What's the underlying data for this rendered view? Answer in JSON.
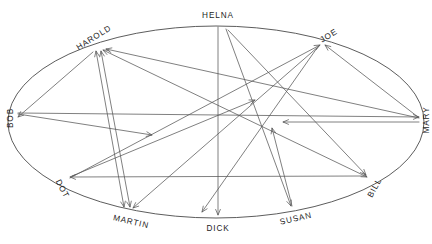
{
  "diagram": {
    "type": "directed-graph-on-ellipse",
    "colors": {
      "background": "#ffffff",
      "ellipse_stroke": "#4a4a4a",
      "edge_stroke": "#555555",
      "label_text": "#1d1d1d"
    },
    "ellipse": {
      "cx": 216,
      "cy": 122,
      "rx": 208,
      "ry": 96
    },
    "nodes": [
      {
        "id": "helna",
        "label": "HELNA",
        "x": 218,
        "y": 26,
        "label_x": 218,
        "label_y": 16,
        "rotate": 0,
        "anchor": "middle"
      },
      {
        "id": "joe",
        "label": "JOE",
        "x": 322,
        "y": 43,
        "label_x": 329,
        "label_y": 36,
        "rotate": -32,
        "anchor": "middle"
      },
      {
        "id": "mary",
        "label": "MARY",
        "x": 422,
        "y": 118,
        "label_x": 427,
        "label_y": 120,
        "rotate": -90,
        "anchor": "middle"
      },
      {
        "id": "bill",
        "label": "BILL",
        "x": 369,
        "y": 179,
        "label_x": 375,
        "label_y": 188,
        "rotate": -62,
        "anchor": "middle"
      },
      {
        "id": "susan",
        "label": "SUSAN",
        "x": 293,
        "y": 208,
        "label_x": 296,
        "label_y": 219,
        "rotate": -13,
        "anchor": "middle"
      },
      {
        "id": "dick",
        "label": "DICK",
        "x": 218,
        "y": 217,
        "label_x": 218,
        "label_y": 229,
        "rotate": 0,
        "anchor": "middle"
      },
      {
        "id": "martin",
        "label": "MARTIN",
        "x": 128,
        "y": 210,
        "label_x": 131,
        "label_y": 222,
        "rotate": 13,
        "anchor": "middle"
      },
      {
        "id": "dot",
        "label": "DOT",
        "x": 68,
        "y": 180,
        "label_x": 62,
        "label_y": 189,
        "rotate": 62,
        "anchor": "middle"
      },
      {
        "id": "bob",
        "label": "BOB",
        "x": 14,
        "y": 116,
        "label_x": 11,
        "label_y": 118,
        "rotate": -90,
        "anchor": "middle"
      },
      {
        "id": "harold",
        "label": "HAROLD",
        "x": 98,
        "y": 48,
        "label_x": 94,
        "label_y": 38,
        "rotate": -32,
        "anchor": "middle"
      }
    ],
    "edges": [
      {
        "id": "e1",
        "from": "helna",
        "to": "dick",
        "x1": 218,
        "y1": 27,
        "x2": 218,
        "y2": 215,
        "arrow_end": true,
        "arrow_start": false
      },
      {
        "id": "e2",
        "from": "helna",
        "to": "susan",
        "x1": 226,
        "y1": 29,
        "x2": 291,
        "y2": 206,
        "arrow_end": true,
        "arrow_start": false
      },
      {
        "id": "e3",
        "from": "joe",
        "to": "martin",
        "x1": 319,
        "y1": 46,
        "x2": 133,
        "y2": 208,
        "arrow_end": true,
        "arrow_start": false
      },
      {
        "id": "e4",
        "from": "mary",
        "to": "joe",
        "x1": 418,
        "y1": 117,
        "x2": 325,
        "y2": 45,
        "arrow_end": true,
        "arrow_start": false
      },
      {
        "id": "e5",
        "from": "bob",
        "to": "mary",
        "x1": 18,
        "y1": 113,
        "x2": 419,
        "y2": 117,
        "arrow_end": true,
        "arrow_start": false
      },
      {
        "id": "e6",
        "from": "mary",
        "to": "center",
        "x1": 419,
        "y1": 122,
        "x2": 283,
        "y2": 122,
        "arrow_end": true,
        "arrow_start": false
      },
      {
        "id": "e7",
        "from": "susan",
        "to": "center",
        "x1": 292,
        "y1": 206,
        "x2": 272,
        "y2": 128,
        "arrow_end": true,
        "arrow_start": false
      },
      {
        "id": "e8",
        "from": "dot",
        "to": "joe",
        "x1": 70,
        "y1": 178,
        "x2": 320,
        "y2": 45,
        "arrow_end": true,
        "arrow_start": false
      },
      {
        "id": "e9",
        "from": "bill",
        "to": "dot",
        "x1": 366,
        "y1": 176,
        "x2": 70,
        "y2": 177,
        "arrow_end": true,
        "arrow_start": false
      },
      {
        "id": "e10",
        "from": "harold",
        "to": "bill",
        "x1": 103,
        "y1": 50,
        "x2": 367,
        "y2": 177,
        "arrow_end": true,
        "arrow_start": true
      },
      {
        "id": "e11",
        "from": "harold",
        "to": "martin",
        "x1": 96,
        "y1": 51,
        "x2": 124,
        "y2": 207,
        "arrow_end": true,
        "arrow_start": true
      },
      {
        "id": "e12",
        "from": "harold",
        "to": "martin",
        "x1": 101,
        "y1": 51,
        "x2": 130,
        "y2": 207,
        "arrow_end": true,
        "arrow_start": true
      },
      {
        "id": "e13",
        "from": "harold",
        "to": "bob",
        "x1": 93,
        "y1": 52,
        "x2": 18,
        "y2": 117,
        "arrow_end": true,
        "arrow_start": false
      },
      {
        "id": "e14",
        "from": "mary",
        "to": "harold",
        "x1": 419,
        "y1": 118,
        "x2": 106,
        "y2": 49,
        "arrow_end": true,
        "arrow_start": false
      },
      {
        "id": "e15",
        "from": "bob",
        "to": "center",
        "x1": 18,
        "y1": 114,
        "x2": 152,
        "y2": 135,
        "arrow_end": true,
        "arrow_start": false
      },
      {
        "id": "e16",
        "from": "dot",
        "to": "center",
        "x1": 72,
        "y1": 176,
        "x2": 255,
        "y2": 100,
        "arrow_end": true,
        "arrow_start": false
      },
      {
        "id": "e17",
        "from": "joe",
        "to": "dick",
        "x1": 317,
        "y1": 48,
        "x2": 202,
        "y2": 212,
        "arrow_end": true,
        "arrow_start": false
      },
      {
        "id": "e18",
        "from": "helna",
        "to": "bill",
        "x1": 228,
        "y1": 30,
        "x2": 366,
        "y2": 175,
        "arrow_end": true,
        "arrow_start": false
      }
    ]
  }
}
